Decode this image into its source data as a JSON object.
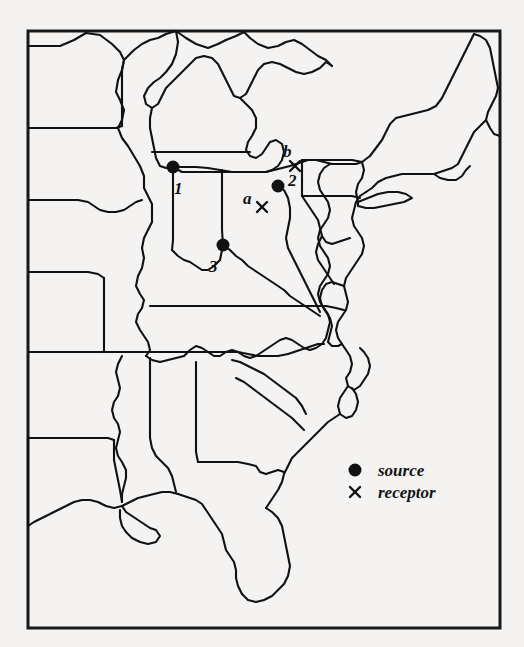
{
  "figure": {
    "type": "map",
    "region": "Eastern and Central United States",
    "background_color": "#f4f3f1",
    "ink_color": "#111111",
    "frame": {
      "x": 28,
      "y": 31,
      "width": 472,
      "height": 597
    }
  },
  "markers": {
    "sources": [
      {
        "id": "source-1",
        "label": "1",
        "x": 173,
        "y": 167,
        "label_x": 174,
        "label_y": 180
      },
      {
        "id": "source-2",
        "label": "2",
        "x": 278,
        "y": 186,
        "label_x": 288,
        "label_y": 172
      },
      {
        "id": "source-3",
        "label": "3",
        "x": 223,
        "y": 245,
        "label_x": 209,
        "label_y": 258
      }
    ],
    "receptors": [
      {
        "id": "receptor-a",
        "label": "a",
        "x": 262,
        "y": 207,
        "label_x": 243,
        "label_y": 190
      },
      {
        "id": "receptor-b",
        "label": "b",
        "x": 295,
        "y": 166,
        "label_x": 283,
        "label_y": 143
      }
    ]
  },
  "legend": {
    "entries": [
      {
        "symbol": "filled-circle",
        "label": "source",
        "symbol_x": 355,
        "symbol_y": 470,
        "text_x": 378,
        "text_y": 463
      },
      {
        "symbol": "x-mark",
        "label": "receptor",
        "symbol_x": 355,
        "symbol_y": 492,
        "text_x": 378,
        "text_y": 485
      }
    ]
  }
}
